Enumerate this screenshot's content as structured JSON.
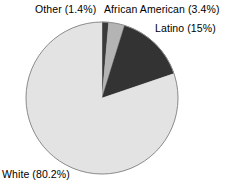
{
  "chart_data": {
    "type": "pie",
    "title": "",
    "subtitle": "",
    "xlabel": "",
    "ylabel": "",
    "grid": false,
    "legend_position": "none",
    "label_style": "outside-callout",
    "start_angle_deg": 0,
    "direction": "clockwise",
    "categories": [
      "Other",
      "African American",
      "Latino",
      "White"
    ],
    "values": [
      1.4,
      3.4,
      15.0,
      80.2
    ],
    "units": "percent",
    "total": 100.0,
    "slices": [
      {
        "name": "Other",
        "value": 1.4,
        "label": "Other (1.4%)",
        "color": "#3a3a3a",
        "start_deg": 0.0,
        "end_deg": 5.04
      },
      {
        "name": "African American",
        "value": 3.4,
        "label": "African American (3.4%)",
        "color": "#b4b4b4",
        "start_deg": 5.04,
        "end_deg": 17.28
      },
      {
        "name": "Latino",
        "value": 15.0,
        "label": "Latino (15%)",
        "color": "#333333",
        "start_deg": 17.28,
        "end_deg": 71.28
      },
      {
        "name": "White",
        "value": 80.2,
        "label": "White (80.2%)",
        "color": "#e3e3e3",
        "start_deg": 71.28,
        "end_deg": 360.0
      }
    ],
    "geometry": {
      "center_x": 102,
      "center_y": 98,
      "radius": 76,
      "outline_color": "#8c8c8c",
      "outline_width": 1
    },
    "background_color": "#ffffff",
    "text_color": "#000000"
  },
  "labels": {
    "other": "Other (1.4%)",
    "african_american": "African American (3.4%)",
    "latino": "Latino (15%)",
    "white": "White (80.2%)"
  }
}
